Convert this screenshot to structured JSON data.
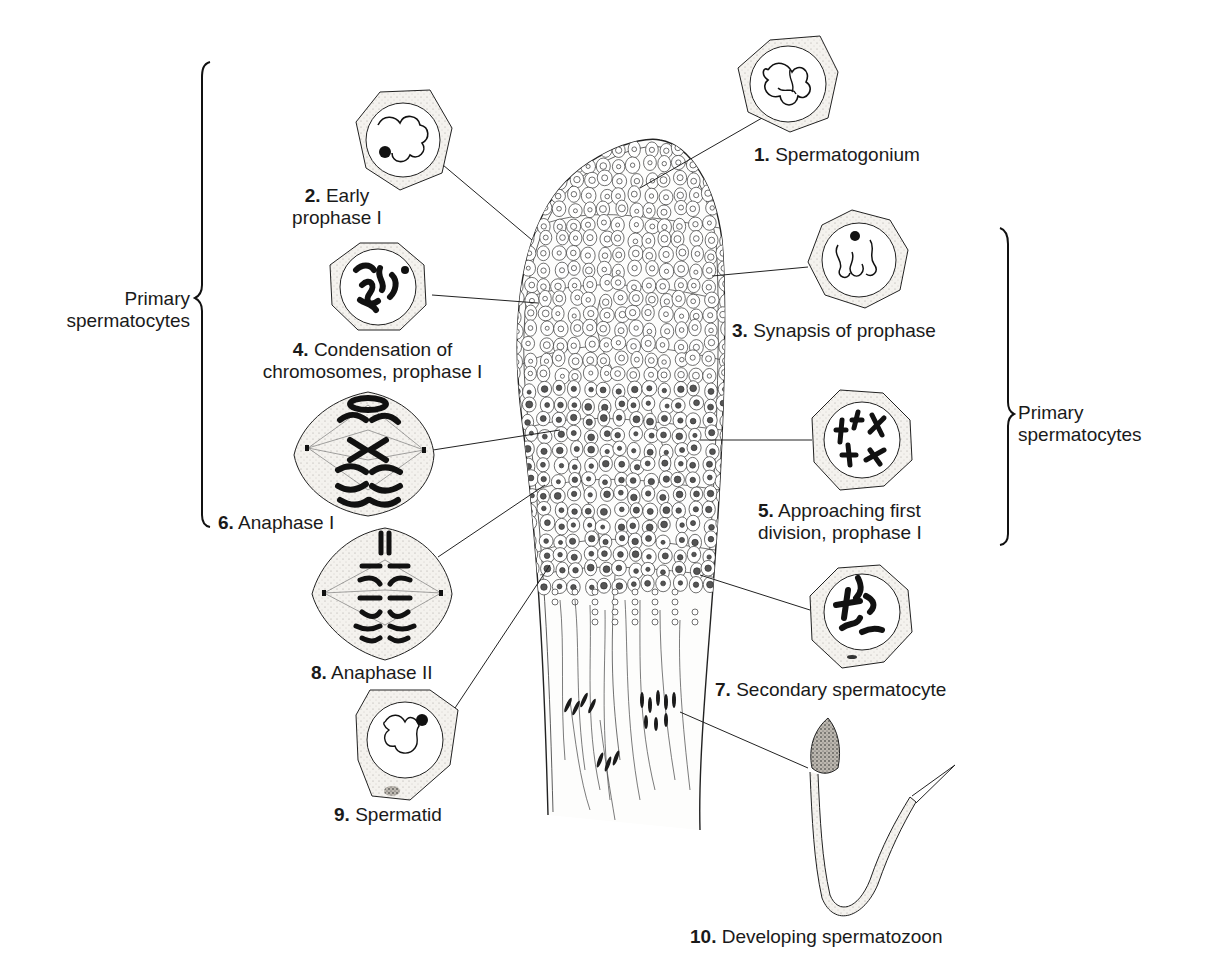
{
  "diagram": {
    "stages": [
      {
        "num": "1.",
        "lines": [
          "Spermatogonium"
        ]
      },
      {
        "num": "2.",
        "lines": [
          "Early",
          "prophase I"
        ]
      },
      {
        "num": "3.",
        "lines": [
          "Synapsis of prophase"
        ]
      },
      {
        "num": "4.",
        "lines": [
          "Condensation of",
          "chromosomes, prophase I"
        ]
      },
      {
        "num": "5.",
        "lines": [
          "Approaching first",
          "division, prophase I"
        ]
      },
      {
        "num": "6.",
        "lines": [
          "Anaphase I"
        ]
      },
      {
        "num": "7.",
        "lines": [
          "Secondary spermatocyte"
        ]
      },
      {
        "num": "8.",
        "lines": [
          "Anaphase II"
        ]
      },
      {
        "num": "9.",
        "lines": [
          "Spermatid"
        ]
      },
      {
        "num": "10.",
        "lines": [
          "Developing spermatozoon"
        ]
      }
    ],
    "groups": {
      "left": [
        "Primary",
        "spermatocytes"
      ],
      "right": [
        "Primary",
        "spermatocytes"
      ]
    }
  },
  "colors": {
    "ink": "#1a1a1a",
    "stipple": "#efece8",
    "background": "#ffffff"
  }
}
